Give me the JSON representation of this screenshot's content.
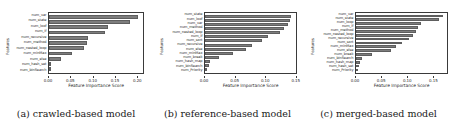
{
  "figure": {
    "background": "#ffffff",
    "bar_color": "#7d7d7d",
    "axis_color": "#3a3a3a",
    "xlabel": "Feature Importance Score",
    "ylabel": "Features"
  },
  "captions": {
    "a": "(a) crawled-based model",
    "b": "(b) reference-based model",
    "c": "(c) merged-based model"
  },
  "chart_data": [
    {
      "type": "bar",
      "orientation": "horizontal",
      "panel": "a",
      "title": "(a) crawled-based model",
      "xlabel": "Feature Importance Score",
      "ylabel": "Features",
      "xlim": [
        0.0,
        0.215
      ],
      "grid": false,
      "legend": null,
      "xticks": [
        "0.00",
        "0.05",
        "0.10",
        "0.15",
        "0.20"
      ],
      "xtick_values": [
        0.0,
        0.05,
        0.1,
        0.15,
        0.2
      ],
      "categories": [
        "num_var",
        "num_state",
        "num_loof",
        "num_if",
        "num_recursive",
        "num_method",
        "num_nested_loop",
        "num_minMax",
        "num_else",
        "num_hash_set",
        "num_binSearch"
      ],
      "values": [
        0.203,
        0.186,
        0.134,
        0.128,
        0.089,
        0.086,
        0.081,
        0.053,
        0.028,
        0.002,
        0.0
      ]
    },
    {
      "type": "bar",
      "orientation": "horizontal",
      "panel": "b",
      "title": "(b) reference-based model",
      "xlabel": "Feature Importance Score",
      "ylabel": "Features",
      "xlim": [
        0.0,
        0.152
      ],
      "grid": false,
      "legend": null,
      "xticks": [
        "0.00",
        "0.05",
        "0.10",
        "0.15"
      ],
      "xtick_values": [
        0.0,
        0.05,
        0.1,
        0.15
      ],
      "categories": [
        "num_state",
        "num_loof",
        "num_var",
        "num_method",
        "num_nested_loop",
        "num_if",
        "num_sort",
        "num_recursive",
        "num_else",
        "num_minMax",
        "num_break",
        "num_hash_map",
        "num_binSearch",
        "num_Priority"
      ],
      "values": [
        0.144,
        0.142,
        0.138,
        0.132,
        0.126,
        0.105,
        0.095,
        0.078,
        0.068,
        0.046,
        0.024,
        0.008,
        0.006,
        0.004
      ]
    },
    {
      "type": "bar",
      "orientation": "horizontal",
      "panel": "c",
      "title": "(c) merged-based model",
      "xlabel": "Feature Importance Score",
      "ylabel": "Features",
      "xlim": [
        0.0,
        0.178
      ],
      "grid": false,
      "legend": null,
      "xticks": [
        "0.00",
        "0.05",
        "0.10",
        "0.15"
      ],
      "xtick_values": [
        0.0,
        0.05,
        0.1,
        0.15
      ],
      "categories": [
        "num_var",
        "num_state",
        "num_loop",
        "num_if",
        "num_method",
        "num_nested_loop",
        "num_recursive",
        "num_sort",
        "num_minMax",
        "num_else",
        "num_break",
        "num_binSearch",
        "num_hash_map",
        "num_hash_set",
        "num_Priority"
      ],
      "values": [
        0.17,
        0.163,
        0.128,
        0.122,
        0.117,
        0.112,
        0.104,
        0.09,
        0.078,
        0.068,
        0.031,
        0.012,
        0.008,
        0.006,
        0.004
      ]
    }
  ]
}
